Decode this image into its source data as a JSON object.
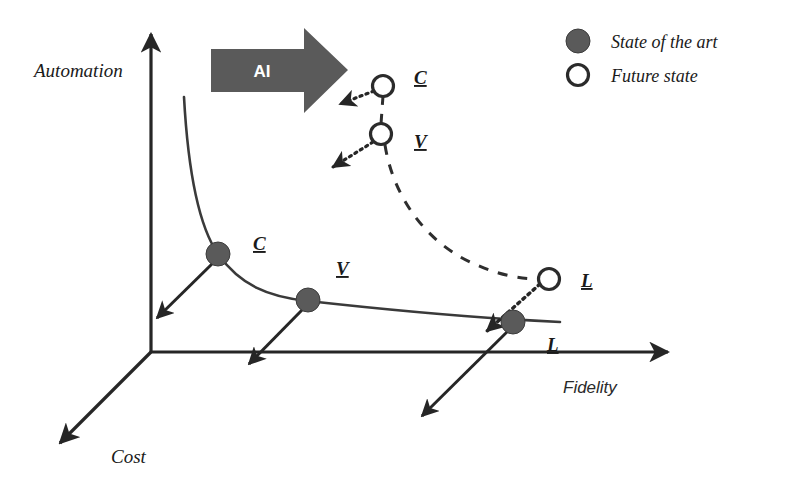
{
  "figure": {
    "background": "#ffffff",
    "ink_color": "#262626",
    "arrow_fill": "#5a5a5a",
    "marker_fill": "#5a5a5a"
  },
  "axes": {
    "y": {
      "name": "Automation",
      "label": "Automation"
    },
    "x": {
      "name": "Fidelity",
      "label": "Fidelity"
    },
    "z": {
      "name": "Cost",
      "label": "Cost"
    }
  },
  "ai_arrow": {
    "label": "AI",
    "color": "#5a5a5a",
    "text_color": "#ffffff"
  },
  "legend": {
    "items": [
      {
        "marker": "filled-circle",
        "label": "State of the art",
        "color": "#5a5a5a"
      },
      {
        "marker": "open-circle",
        "label": "Future state",
        "color": "#ffffff"
      }
    ]
  },
  "state_of_the_art": {
    "curve_style": "solid",
    "points": [
      {
        "id": "C",
        "label": "C",
        "marker": "filled-circle",
        "x": 218,
        "y": 254,
        "label_x": 262,
        "label_y": 249
      },
      {
        "id": "V",
        "label": "V",
        "marker": "filled-circle",
        "x": 308,
        "y": 300,
        "label_x": 341,
        "label_y": 274
      },
      {
        "id": "L",
        "label": "L",
        "marker": "filled-circle",
        "x": 513,
        "y": 322,
        "label_x": 551,
        "label_y": 348
      }
    ]
  },
  "future_state": {
    "curve_style": "dashed",
    "points": [
      {
        "id": "C",
        "label": "C",
        "marker": "open-circle",
        "x": 383,
        "y": 86,
        "label_x": 421,
        "label_y": 82
      },
      {
        "id": "V",
        "label": "V",
        "marker": "open-circle",
        "x": 381,
        "y": 134,
        "label_x": 421,
        "label_y": 146
      },
      {
        "id": "L",
        "label": "L",
        "marker": "open-circle",
        "x": 549,
        "y": 279,
        "label_x": 585,
        "label_y": 285
      }
    ]
  },
  "cost_arrows": {
    "style": "solid",
    "description": "Solid arrows from state-of-the-art points toward the Cost axis direction"
  },
  "transition_arrows": {
    "style": "dotted",
    "description": "Dotted arrows from future-state points toward the Cost axis direction"
  }
}
